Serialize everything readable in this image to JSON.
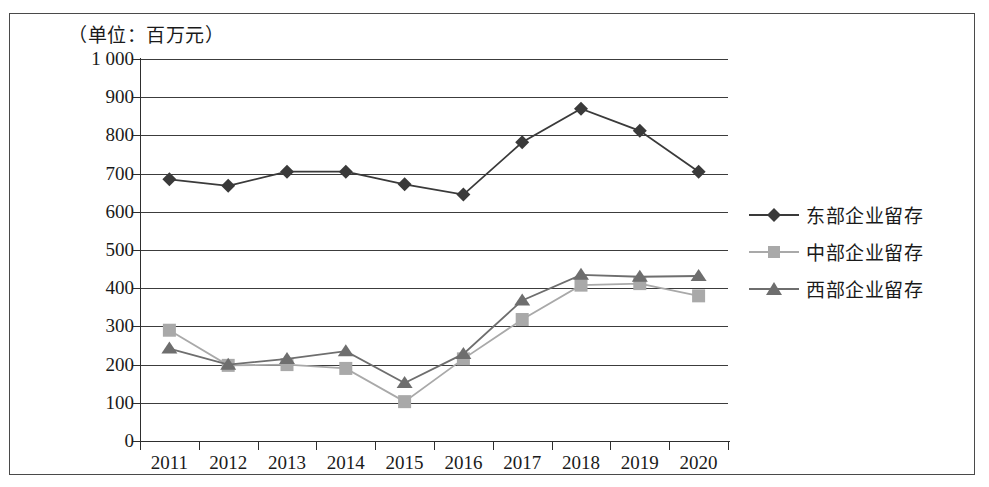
{
  "figure": {
    "unit_caption": "（单位：百万元）"
  },
  "chart_data": {
    "type": "line",
    "title": "",
    "subtitle": "",
    "xlabel": "",
    "ylabel": "（单位：百万元）",
    "categories": [
      "2011",
      "2012",
      "2013",
      "2014",
      "2015",
      "2016",
      "2017",
      "2018",
      "2019",
      "2020"
    ],
    "ylim": [
      0,
      1000
    ],
    "ytick_labels": [
      "1 000",
      "900",
      "800",
      "700",
      "600",
      "500",
      "400",
      "300",
      "200",
      "100",
      "0"
    ],
    "ytick_values": [
      1000,
      900,
      800,
      700,
      600,
      500,
      400,
      300,
      200,
      100,
      0
    ],
    "grid": "horizontal",
    "legend_position": "right",
    "series": [
      {
        "name": "东部企业留存",
        "marker": "diamond",
        "color": "#3a3a3a",
        "values": [
          685,
          668,
          705,
          705,
          672,
          645,
          782,
          870,
          812,
          705
        ]
      },
      {
        "name": "中部企业留存",
        "marker": "square",
        "color": "#a9a9a9",
        "values": [
          290,
          198,
          200,
          190,
          103,
          215,
          318,
          408,
          412,
          380
        ]
      },
      {
        "name": "西部企业留存",
        "marker": "triangle",
        "color": "#6e6e6e",
        "values": [
          242,
          200,
          215,
          235,
          152,
          228,
          368,
          435,
          430,
          432
        ]
      }
    ]
  },
  "legend": {
    "items": [
      {
        "label": "东部企业留存",
        "marker": "diamond-marker",
        "color": "#3a3a3a"
      },
      {
        "label": "中部企业留存",
        "marker": "square-marker",
        "color": "#a9a9a9"
      },
      {
        "label": "西部企业留存",
        "marker": "triangle-marker",
        "color": "#6e6e6e"
      }
    ]
  }
}
